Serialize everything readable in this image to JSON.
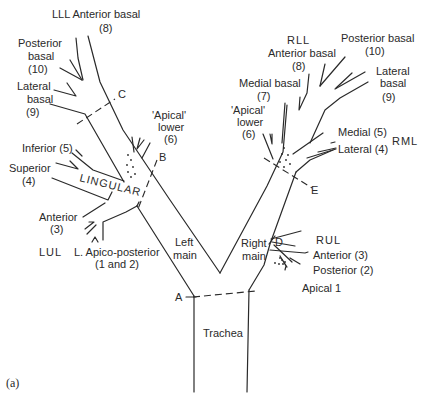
{
  "figure_label": "(a)",
  "trachea": {
    "label": "Trachea"
  },
  "left_main": {
    "label_line1": "Left",
    "label_line2": "main"
  },
  "right_main": {
    "label_line1": "Right",
    "label_line2": "main"
  },
  "markers": {
    "A": "A",
    "B": "B",
    "C": "C",
    "D": "D",
    "E": "E"
  },
  "left": {
    "lll": {
      "title": "LLL Anterior basal",
      "anterior_basal_num": "(8)",
      "posterior_basal": [
        "Posterior",
        "basal",
        "(10)"
      ],
      "lateral_basal": [
        "Lateral",
        "basal",
        "(9)"
      ],
      "apical_lower": [
        "'Apical'",
        "lower",
        "(6)"
      ]
    },
    "lingular": {
      "title": "LINGULAR",
      "inferior": "Inferior (5)",
      "superior": [
        "Superior",
        "(4)"
      ]
    },
    "lul": {
      "title": "LUL",
      "anterior": [
        "Anterior",
        "(3)"
      ],
      "apico_posterior": [
        "L. Apico-posterior",
        "(1 and 2)"
      ]
    }
  },
  "right": {
    "rll": {
      "title": "RLL",
      "anterior_basal": [
        "Anterior basal",
        "(8)"
      ],
      "posterior_basal": [
        "Posterior basal",
        "(10)"
      ],
      "lateral_basal": [
        "Lateral",
        "basal",
        "(9)"
      ],
      "medial_basal": [
        "Medial basal",
        "(7)"
      ],
      "apical_lower": [
        "'Apical'",
        "lower",
        "(6)"
      ]
    },
    "rml": {
      "title": "RML",
      "medial": "Medial (5)",
      "lateral": "Lateral (4)"
    },
    "rul": {
      "title": "RUL",
      "anterior": "Anterior (3)",
      "posterior": "Posterior (2)",
      "apical": "Apical 1"
    }
  }
}
